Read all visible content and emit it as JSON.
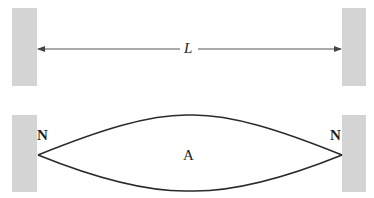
{
  "diagram": {
    "top": {
      "length_label": "L"
    },
    "bottom": {
      "left_node_label": "N",
      "right_node_label": "N",
      "antinode_label": "A"
    },
    "colors": {
      "wall": "#d4d4d4",
      "line": "#2a2a2a",
      "arrow": "#555555"
    }
  }
}
